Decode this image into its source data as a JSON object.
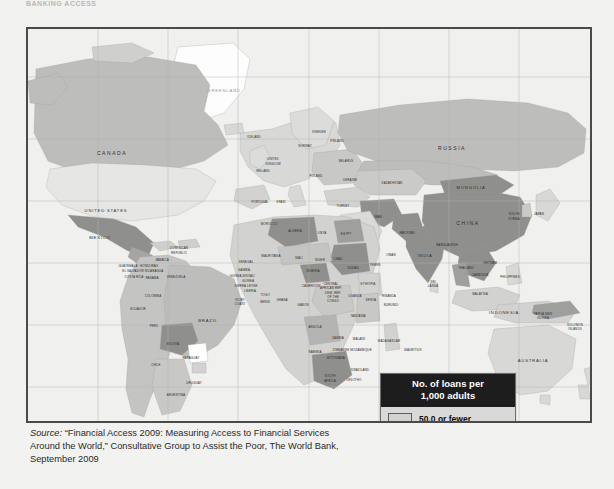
{
  "cut_header_text": "BANKING ACCESS",
  "map": {
    "title": "No. of loans per 1,000 adults",
    "projection_note": "world map",
    "grid_visible": true,
    "colors": {
      "fewest": "#d2d2d0",
      "low_mid": "#8f8f8d",
      "mid_high": "#bdbdbb",
      "highest": "#e2e2e0",
      "no_data": "#ffffff",
      "ocean": "#f0f0ee",
      "border": "#4a4a4a",
      "grid": "#b4b4b2",
      "legend_header_bg": "#1d1d1d",
      "legend_bg": "#d9d9d7"
    }
  },
  "legend": {
    "title_line1": "No. of loans per",
    "title_line2": "1,000 adults",
    "entries": [
      {
        "label": "50.0 or fewer",
        "color": "#d2d2d0"
      },
      {
        "label": "50.1-300.0",
        "color": "#8f8f8d"
      },
      {
        "label": "300.1-800.0",
        "color": "#bdbdbb"
      },
      {
        "label": "800.1+",
        "color": "#e4e4e2"
      },
      {
        "label": "No data",
        "color": "#ffffff"
      }
    ]
  },
  "source": {
    "label": "Source:",
    "line1": "“Financial Access 2009: Measuring Access to Financial",
    "line2": "Services Around the World,” Consultative Group to Assist the Poor,",
    "line3": "The World Bank, September 2009"
  },
  "map_labels": [
    {
      "name": "GREENLAND",
      "x": 196,
      "y": 63,
      "cls": "clabel mid faint"
    },
    {
      "name": "CANADA",
      "x": 84,
      "y": 126,
      "cls": "clabel big"
    },
    {
      "name": "UNITED STATES",
      "x": 78,
      "y": 183,
      "cls": "clabel mid"
    },
    {
      "name": "MEXICO",
      "x": 72,
      "y": 210,
      "cls": "clabel mid"
    },
    {
      "name": "ICELAND",
      "x": 226,
      "y": 109,
      "cls": "clabel tiny"
    },
    {
      "name": "SWEDEN",
      "x": 291,
      "y": 104,
      "cls": "clabel tiny"
    },
    {
      "name": "FINLAND",
      "x": 309,
      "y": 113,
      "cls": "clabel tiny"
    },
    {
      "name": "NORWAY",
      "x": 277,
      "y": 118,
      "cls": "clabel tiny"
    },
    {
      "name": "UNITED",
      "x": 245,
      "y": 131,
      "cls": "clabel tiny"
    },
    {
      "name": "KINGDOM",
      "x": 245,
      "y": 136,
      "cls": "clabel tiny"
    },
    {
      "name": "IRELAND",
      "x": 235,
      "y": 143,
      "cls": "clabel tiny"
    },
    {
      "name": "BELARUS",
      "x": 318,
      "y": 133,
      "cls": "clabel tiny"
    },
    {
      "name": "POLAND",
      "x": 288,
      "y": 148,
      "cls": "clabel tiny"
    },
    {
      "name": "UKRAINE",
      "x": 322,
      "y": 152,
      "cls": "clabel tiny"
    },
    {
      "name": "PORTUGAL",
      "x": 232,
      "y": 174,
      "cls": "clabel tiny"
    },
    {
      "name": "SPAIN",
      "x": 253,
      "y": 174,
      "cls": "clabel tiny"
    },
    {
      "name": "RUSSIA",
      "x": 424,
      "y": 121,
      "cls": "clabel big"
    },
    {
      "name": "KAZAKHSTAN",
      "x": 364,
      "y": 155,
      "cls": "clabel tiny"
    },
    {
      "name": "MONGOLIA",
      "x": 443,
      "y": 160,
      "cls": "clabel mid"
    },
    {
      "name": "CHINA",
      "x": 440,
      "y": 196,
      "cls": "clabel big"
    },
    {
      "name": "SOUTH",
      "x": 486,
      "y": 186,
      "cls": "clabel tiny"
    },
    {
      "name": "KOREA",
      "x": 486,
      "y": 191,
      "cls": "clabel tiny"
    },
    {
      "name": "JAPAN",
      "x": 511,
      "y": 186,
      "cls": "clabel tiny"
    },
    {
      "name": "TURKEY",
      "x": 315,
      "y": 178,
      "cls": "clabel tiny"
    },
    {
      "name": "IRAN",
      "x": 350,
      "y": 189,
      "cls": "clabel tiny"
    },
    {
      "name": "PAKISTAN",
      "x": 379,
      "y": 205,
      "cls": "clabel tiny"
    },
    {
      "name": "OMAN",
      "x": 363,
      "y": 227,
      "cls": "clabel tiny"
    },
    {
      "name": "YEMEN",
      "x": 347,
      "y": 237,
      "cls": "clabel tiny"
    },
    {
      "name": "INDIA",
      "x": 397,
      "y": 228,
      "cls": "clabel mid"
    },
    {
      "name": "BANGLADESH",
      "x": 419,
      "y": 217,
      "cls": "clabel tiny"
    },
    {
      "name": "SRI",
      "x": 405,
      "y": 254,
      "cls": "clabel tiny"
    },
    {
      "name": "LANKA",
      "x": 405,
      "y": 258,
      "cls": "clabel tiny"
    },
    {
      "name": "THAILAND",
      "x": 438,
      "y": 240,
      "cls": "clabel tiny"
    },
    {
      "name": "VIETNAM",
      "x": 462,
      "y": 235,
      "cls": "clabel tiny"
    },
    {
      "name": "CAMBODIA",
      "x": 452,
      "y": 247,
      "cls": "clabel tiny"
    },
    {
      "name": "PHILIPPINES",
      "x": 482,
      "y": 249,
      "cls": "clabel tiny"
    },
    {
      "name": "MALAYSIA",
      "x": 452,
      "y": 266,
      "cls": "clabel tiny"
    },
    {
      "name": "INDONESIA",
      "x": 476,
      "y": 285,
      "cls": "clabel mid"
    },
    {
      "name": "PAPUA NEW",
      "x": 515,
      "y": 286,
      "cls": "clabel tiny"
    },
    {
      "name": "GUINEA",
      "x": 515,
      "y": 290,
      "cls": "clabel tiny"
    },
    {
      "name": "SOLOMON",
      "x": 547,
      "y": 297,
      "cls": "clabel tiny"
    },
    {
      "name": "ISLANDS",
      "x": 547,
      "y": 301,
      "cls": "clabel tiny"
    },
    {
      "name": "AUSTRALIA",
      "x": 505,
      "y": 333,
      "cls": "clabel mid"
    },
    {
      "name": "NEW",
      "x": 570,
      "y": 376,
      "cls": "clabel tiny"
    },
    {
      "name": "ZEALAND",
      "x": 570,
      "y": 381,
      "cls": "clabel tiny"
    },
    {
      "name": "DOMINICAN",
      "x": 151,
      "y": 220,
      "cls": "clabel tiny"
    },
    {
      "name": "REPUBLIC",
      "x": 151,
      "y": 225,
      "cls": "clabel tiny"
    },
    {
      "name": "JAMAICA",
      "x": 134,
      "y": 232,
      "cls": "clabel tiny"
    },
    {
      "name": "HONDURAS",
      "x": 121,
      "y": 238,
      "cls": "clabel tiny"
    },
    {
      "name": "EL SALVADOR",
      "x": 105,
      "y": 243,
      "cls": "clabel tiny"
    },
    {
      "name": "NICARAGUA",
      "x": 126,
      "y": 243,
      "cls": "clabel tiny"
    },
    {
      "name": "GUATEMALA",
      "x": 100,
      "y": 238,
      "cls": "clabel tiny"
    },
    {
      "name": "COSTA RICA",
      "x": 106,
      "y": 249,
      "cls": "clabel tiny"
    },
    {
      "name": "PANAMA",
      "x": 124,
      "y": 250,
      "cls": "clabel tiny"
    },
    {
      "name": "VENEZUELA",
      "x": 148,
      "y": 249,
      "cls": "clabel tiny"
    },
    {
      "name": "COLOMBIA",
      "x": 125,
      "y": 268,
      "cls": "clabel tiny"
    },
    {
      "name": "ECUADOR",
      "x": 110,
      "y": 281,
      "cls": "clabel tiny"
    },
    {
      "name": "PERU",
      "x": 126,
      "y": 298,
      "cls": "clabel tiny"
    },
    {
      "name": "BRAZIL",
      "x": 180,
      "y": 293,
      "cls": "clabel mid"
    },
    {
      "name": "BOLIVIA",
      "x": 145,
      "y": 316,
      "cls": "clabel tiny"
    },
    {
      "name": "PARAGUAY",
      "x": 163,
      "y": 330,
      "cls": "clabel tiny"
    },
    {
      "name": "CHILE",
      "x": 128,
      "y": 337,
      "cls": "clabel tiny"
    },
    {
      "name": "URUGUAY",
      "x": 166,
      "y": 355,
      "cls": "clabel tiny"
    },
    {
      "name": "ARGENTINA",
      "x": 148,
      "y": 367,
      "cls": "clabel tiny"
    },
    {
      "name": "MOROCCO",
      "x": 241,
      "y": 196,
      "cls": "clabel tiny"
    },
    {
      "name": "ALGERIA",
      "x": 267,
      "y": 203,
      "cls": "clabel tiny"
    },
    {
      "name": "LIBYA",
      "x": 294,
      "y": 205,
      "cls": "clabel tiny"
    },
    {
      "name": "EGYPT",
      "x": 318,
      "y": 206,
      "cls": "clabel tiny"
    },
    {
      "name": "MAURITANIA",
      "x": 243,
      "y": 228,
      "cls": "clabel tiny"
    },
    {
      "name": "MALI",
      "x": 271,
      "y": 230,
      "cls": "clabel tiny"
    },
    {
      "name": "NIGER",
      "x": 292,
      "y": 232,
      "cls": "clabel tiny"
    },
    {
      "name": "CHAD",
      "x": 310,
      "y": 231,
      "cls": "clabel tiny"
    },
    {
      "name": "SUDAN",
      "x": 325,
      "y": 240,
      "cls": "clabel tiny"
    },
    {
      "name": "SENEGAL",
      "x": 218,
      "y": 234,
      "cls": "clabel tiny"
    },
    {
      "name": "GAMBIA",
      "x": 216,
      "y": 242,
      "cls": "clabel tiny"
    },
    {
      "name": "GUINEA-BISSAU",
      "x": 214,
      "y": 248,
      "cls": "clabel tiny"
    },
    {
      "name": "GUINEA",
      "x": 220,
      "y": 253,
      "cls": "clabel tiny"
    },
    {
      "name": "SIERRA LEONE",
      "x": 218,
      "y": 258,
      "cls": "clabel tiny"
    },
    {
      "name": "LIBERIA",
      "x": 222,
      "y": 263,
      "cls": "clabel tiny"
    },
    {
      "name": "IVORY",
      "x": 212,
      "y": 272,
      "cls": "clabel tiny"
    },
    {
      "name": "COAST",
      "x": 212,
      "y": 276,
      "cls": "clabel tiny"
    },
    {
      "name": "BENIN",
      "x": 237,
      "y": 274,
      "cls": "clabel tiny"
    },
    {
      "name": "TOGO",
      "x": 237,
      "y": 267,
      "cls": "clabel tiny"
    },
    {
      "name": "GHANA",
      "x": 254,
      "y": 272,
      "cls": "clabel tiny"
    },
    {
      "name": "NIGERIA",
      "x": 285,
      "y": 243,
      "cls": "clabel tiny"
    },
    {
      "name": "CAMEROON",
      "x": 283,
      "y": 258,
      "cls": "clabel tiny"
    },
    {
      "name": "CENTRAL",
      "x": 303,
      "y": 256,
      "cls": "clabel tiny"
    },
    {
      "name": "AFRICAN REP.",
      "x": 303,
      "y": 260,
      "cls": "clabel tiny"
    },
    {
      "name": "GABON",
      "x": 275,
      "y": 277,
      "cls": "clabel tiny"
    },
    {
      "name": "DEM. REP.",
      "x": 305,
      "y": 265,
      "cls": "clabel tiny"
    },
    {
      "name": "OF THE",
      "x": 305,
      "y": 269,
      "cls": "clabel tiny"
    },
    {
      "name": "CONGO",
      "x": 305,
      "y": 273,
      "cls": "clabel tiny"
    },
    {
      "name": "ETHIOPIA",
      "x": 340,
      "y": 256,
      "cls": "clabel tiny"
    },
    {
      "name": "UGANDA",
      "x": 327,
      "y": 268,
      "cls": "clabel tiny"
    },
    {
      "name": "KENYA",
      "x": 343,
      "y": 272,
      "cls": "clabel tiny"
    },
    {
      "name": "RWANDA",
      "x": 361,
      "y": 268,
      "cls": "clabel tiny"
    },
    {
      "name": "BURUNDI",
      "x": 363,
      "y": 277,
      "cls": "clabel tiny"
    },
    {
      "name": "TANZANIA",
      "x": 330,
      "y": 288,
      "cls": "clabel tiny"
    },
    {
      "name": "ANGOLA",
      "x": 287,
      "y": 299,
      "cls": "clabel tiny"
    },
    {
      "name": "ZAMBIA",
      "x": 310,
      "y": 310,
      "cls": "clabel tiny"
    },
    {
      "name": "MALAWI",
      "x": 331,
      "y": 311,
      "cls": "clabel tiny"
    },
    {
      "name": "MOZAMBIQUE",
      "x": 333,
      "y": 322,
      "cls": "clabel tiny"
    },
    {
      "name": "MADAGASCAR",
      "x": 361,
      "y": 313,
      "cls": "clabel tiny"
    },
    {
      "name": "MAURITIUS",
      "x": 385,
      "y": 322,
      "cls": "clabel tiny"
    },
    {
      "name": "ZIMBABWE",
      "x": 313,
      "y": 322,
      "cls": "clabel tiny"
    },
    {
      "name": "NAMIBIA",
      "x": 287,
      "y": 324,
      "cls": "clabel tiny"
    },
    {
      "name": "BOTSWANA",
      "x": 308,
      "y": 330,
      "cls": "clabel tiny"
    },
    {
      "name": "SWAZILAND",
      "x": 332,
      "y": 342,
      "cls": "clabel tiny"
    },
    {
      "name": "LESOTHO",
      "x": 326,
      "y": 352,
      "cls": "clabel tiny"
    },
    {
      "name": "SOUTH",
      "x": 302,
      "y": 348,
      "cls": "clabel tiny"
    },
    {
      "name": "AFRICA",
      "x": 302,
      "y": 353,
      "cls": "clabel tiny"
    }
  ],
  "chart_data": {
    "type": "heatmap",
    "title": "No. of loans per 1,000 adults",
    "legend_position": "bottom-right",
    "categories": [
      "50.0 or fewer",
      "50.1-300.0",
      "300.1-800.0",
      "800.1+",
      "No data"
    ],
    "colors": [
      "#d2d2d0",
      "#8f8f8d",
      "#bdbdbb",
      "#e4e4e2",
      "#ffffff"
    ],
    "regions": [
      {
        "name": "United States",
        "class": "800.1+"
      },
      {
        "name": "Canada",
        "class": "300.1-800.0"
      },
      {
        "name": "Mexico",
        "class": "50.1-300.0"
      },
      {
        "name": "Brazil",
        "class": "300.1-800.0"
      },
      {
        "name": "Bolivia",
        "class": "50.1-300.0"
      },
      {
        "name": "Paraguay",
        "class": "800.1+"
      },
      {
        "name": "Chile",
        "class": "300.1-800.0"
      },
      {
        "name": "Argentina",
        "class": "300.1-800.0"
      },
      {
        "name": "Russia",
        "class": "300.1-800.0"
      },
      {
        "name": "China",
        "class": "50.1-300.0"
      },
      {
        "name": "Mongolia",
        "class": "50.1-300.0"
      },
      {
        "name": "India",
        "class": "50.1-300.0"
      },
      {
        "name": "Iran",
        "class": "50.1-300.0"
      },
      {
        "name": "Algeria",
        "class": "50.1-300.0"
      },
      {
        "name": "Sudan",
        "class": "50.1-300.0"
      },
      {
        "name": "Ethiopia",
        "class": "50.0 or fewer"
      },
      {
        "name": "South Africa",
        "class": "50.1-300.0"
      },
      {
        "name": "Australia",
        "class": "50.0 or fewer"
      },
      {
        "name": "Greenland",
        "class": "No data"
      },
      {
        "name": "Thailand",
        "class": "50.1-300.0"
      },
      {
        "name": "Indonesia",
        "class": "50.0 or fewer"
      }
    ]
  }
}
